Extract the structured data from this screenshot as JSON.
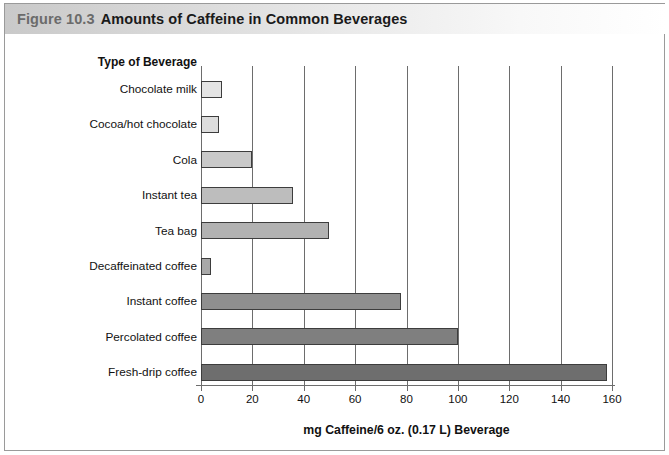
{
  "figure": {
    "number_label": "Figure 10.3",
    "title": "Amounts of Caffeine in Common Beverages"
  },
  "chart_data": {
    "type": "bar",
    "orientation": "horizontal",
    "title": "Amounts of Caffeine in Common Beverages",
    "xlabel": "mg Caffeine/6 oz. (0.17 L) Beverage",
    "ylabel": "Type of Beverage",
    "xlim": [
      0,
      165
    ],
    "xticks": [
      0,
      20,
      40,
      60,
      80,
      100,
      120,
      140,
      160
    ],
    "xtick_labels": [
      "0",
      "20",
      "40",
      "60",
      "80",
      "100",
      "120",
      "140",
      "160"
    ],
    "grid": "vertical",
    "legend": "none",
    "categories": [
      "Chocolate milk",
      "Cocoa/hot chocolate",
      "Cola",
      "Instant tea",
      "Tea bag",
      "Decaffeinated coffee",
      "Instant coffee",
      "Percolated coffee",
      "Fresh-drip coffee"
    ],
    "values": [
      8,
      7,
      20,
      36,
      50,
      4,
      78,
      100,
      158
    ],
    "bar_colors": [
      "#e4e4e4",
      "#dcdcdc",
      "#c9c9c9",
      "#bdbdbd",
      "#b2b2b2",
      "#a8a8a8",
      "#8f8f8f",
      "#7f7f7f",
      "#6e6e6e"
    ]
  },
  "colors": {
    "axis": "#6d6d6d",
    "bar_outline": "#3d3d3d",
    "frame": "#9a9a9a",
    "title_figno": "#6b6b6b",
    "title_text": "#1a1a1a"
  }
}
